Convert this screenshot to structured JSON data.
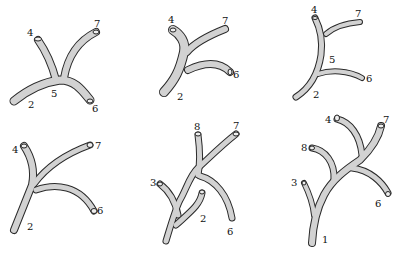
{
  "panels": [
    {
      "id": "a",
      "labels": {
        "l4": "4",
        "l7": "7",
        "l5": "5",
        "l2": "2",
        "l6": "6"
      }
    },
    {
      "id": "b",
      "labels": {
        "l4": "4",
        "l7": "7",
        "l6": "6",
        "l2": "2"
      }
    },
    {
      "id": "c",
      "labels": {
        "l4": "4",
        "l7": "7",
        "l5": "5",
        "l6": "6",
        "l2": "2"
      }
    },
    {
      "id": "d",
      "labels": {
        "l4": "4",
        "l7": "7",
        "l6": "6",
        "l2": "2"
      }
    },
    {
      "id": "e",
      "labels": {
        "l8": "8",
        "l7": "7",
        "l3": "3",
        "l2": "2",
        "l6": "6"
      }
    },
    {
      "id": "f",
      "labels": {
        "l4": "4",
        "l7": "7",
        "l8": "8",
        "l3": "3",
        "l6": "6",
        "l1": "1"
      }
    }
  ]
}
